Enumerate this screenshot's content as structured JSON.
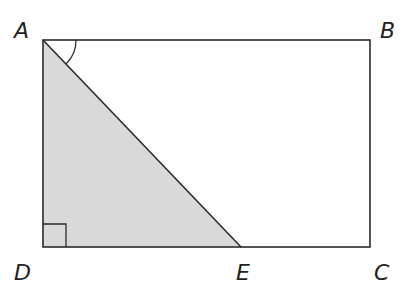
{
  "diagram": {
    "type": "geometry",
    "points": {
      "A": {
        "label": "A"
      },
      "B": {
        "label": "B"
      },
      "C": {
        "label": "C"
      },
      "D": {
        "label": "D"
      },
      "E": {
        "label": "E"
      }
    },
    "shapes": [
      {
        "name": "rectangle",
        "vertices": [
          "A",
          "B",
          "C",
          "D"
        ]
      },
      {
        "name": "shaded-triangle",
        "vertices": [
          "A",
          "D",
          "E"
        ]
      }
    ],
    "segments": [
      [
        "A",
        "B"
      ],
      [
        "B",
        "C"
      ],
      [
        "C",
        "D"
      ],
      [
        "D",
        "A"
      ],
      [
        "A",
        "E"
      ]
    ],
    "angle_marks": [
      {
        "vertex": "A",
        "between": [
          "B",
          "E"
        ],
        "kind": "arc"
      },
      {
        "vertex": "D",
        "between": [
          "A",
          "E"
        ],
        "kind": "right-angle"
      }
    ],
    "colors": {
      "stroke": "#2b2b2b",
      "shade": "#d9d9d9",
      "label": "#222222"
    }
  }
}
